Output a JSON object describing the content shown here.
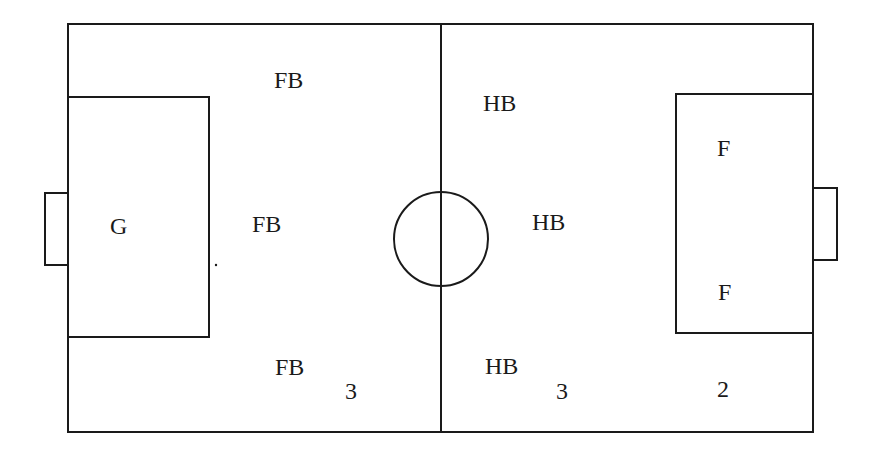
{
  "diagram": {
    "type": "soccer-field-formation",
    "line_color": "#1a1a1a",
    "background": "#ffffff"
  },
  "positions": [
    {
      "id": "goalkeeper",
      "label": "G",
      "x": 110,
      "y": 214
    },
    {
      "id": "fullback-top",
      "label": "FB",
      "x": 274,
      "y": 68
    },
    {
      "id": "fullback-middle",
      "label": "FB",
      "x": 252,
      "y": 212
    },
    {
      "id": "fullback-bottom",
      "label": "FB",
      "x": 275,
      "y": 355
    },
    {
      "id": "halfback-top",
      "label": "HB",
      "x": 483,
      "y": 91
    },
    {
      "id": "halfback-middle",
      "label": "HB",
      "x": 532,
      "y": 210
    },
    {
      "id": "halfback-bottom",
      "label": "HB",
      "x": 485,
      "y": 354
    },
    {
      "id": "forward-top",
      "label": "F",
      "x": 717,
      "y": 136
    },
    {
      "id": "forward-bottom",
      "label": "F",
      "x": 718,
      "y": 280
    }
  ],
  "counts": [
    {
      "id": "fullback-count",
      "label": "3",
      "x": 345,
      "y": 379
    },
    {
      "id": "halfback-count",
      "label": "3",
      "x": 556,
      "y": 379
    },
    {
      "id": "forward-count",
      "label": "2",
      "x": 717,
      "y": 377
    }
  ],
  "labels_flat": [
    "G",
    "FB",
    "FB",
    "FB",
    "HB",
    "HB",
    "HB",
    "F",
    "F",
    "3",
    "3",
    "2"
  ]
}
